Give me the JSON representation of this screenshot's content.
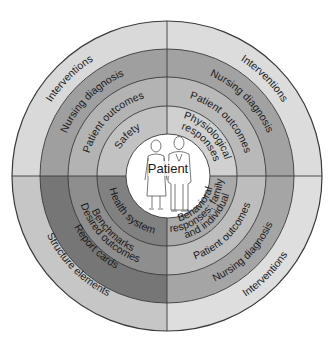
{
  "diagram": {
    "center": {
      "label": "Patient"
    },
    "quadrants": {
      "top_left": {
        "rings": [
          {
            "label": "Safety",
            "color": "#c2c2c2"
          },
          {
            "label": "Patient outcomes",
            "color": "#b3b3b3"
          },
          {
            "label": "Nursing diagnosis",
            "color": "#9f9f9f"
          },
          {
            "label": "Interventions",
            "color": "#d9d9d9"
          }
        ]
      },
      "top_right": {
        "rings": [
          {
            "label": "Physiological responses",
            "label_line1": "Physiological",
            "label_line2": "responses",
            "color": "#d0d0d0"
          },
          {
            "label": "Patient outcomes",
            "color": "#b9b9b9"
          },
          {
            "label": "Nursing diagnosis",
            "color": "#a2a2a2"
          },
          {
            "label": "Interventions",
            "color": "#dcdcdc"
          }
        ]
      },
      "bottom_left": {
        "rings": [
          {
            "label": "Health system",
            "color": "#818181"
          },
          {
            "label": "Benchmarks / Desired outcomes",
            "label_line1": "Benchmarks",
            "label_line2": "Desired outcomes",
            "color": "#8e8e8e"
          },
          {
            "label": "Report cards",
            "color": "#767676"
          },
          {
            "label": "Structure elements",
            "color": "#c6c6c6"
          }
        ]
      },
      "bottom_right": {
        "rings": [
          {
            "label": "Behavioral responses: family and individual",
            "label_line1": "Behavioral",
            "label_line2": "responses: family",
            "label_line3": "and individual",
            "color": "#a9a9a9"
          },
          {
            "label": "Patient outcomes",
            "color": "#bdbdbd"
          },
          {
            "label": "Nursing diagnosis",
            "color": "#a5a5a5"
          },
          {
            "label": "Interventions",
            "color": "#dedede"
          }
        ]
      }
    },
    "line_color": "#3a3a3a"
  }
}
